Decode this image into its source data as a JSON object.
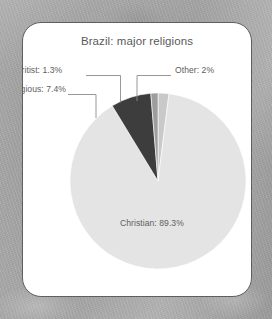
{
  "card": {
    "title": "Brazil: major religions"
  },
  "chart_data": {
    "type": "pie",
    "title": "Brazil: major religions",
    "xlabel": "",
    "ylabel": "",
    "legend_position": "none",
    "grid": false,
    "units": "percent",
    "categories": [
      "Other",
      "Christian",
      "Nonreligious",
      "Spiritist"
    ],
    "values": [
      2,
      89.3,
      7.4,
      1.3
    ],
    "colors": [
      "#c9c9c9",
      "#e4e4e4",
      "#3d3d3d",
      "#9d9d9d"
    ],
    "start_angle_deg": 0,
    "direction": "clockwise",
    "labels": [
      {
        "name": "Other",
        "text": "Other: 2%",
        "value": 2,
        "color": "#c9c9c9",
        "placement": "outside-right"
      },
      {
        "name": "Christian",
        "text": "Christian: 89.3%",
        "value": 89.3,
        "color": "#e4e4e4",
        "placement": "inside"
      },
      {
        "name": "Nonreligious",
        "text": "Nonreligious: 7.4%",
        "value": 7.4,
        "color": "#3d3d3d",
        "placement": "outside-left"
      },
      {
        "name": "Spiritist",
        "text": "Spiritist: 1.3%",
        "value": 1.3,
        "color": "#9d9d9d",
        "placement": "outside-left"
      }
    ]
  },
  "style": {
    "card_background": "#ffffff",
    "card_border": "#5f5f5f",
    "page_background": "#a9a9a9",
    "text_color": "#5a5a5a",
    "leader_line_color": "#888888"
  }
}
